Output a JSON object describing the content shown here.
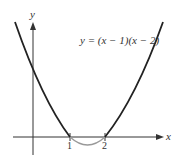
{
  "diagram": {
    "equation": "y = (x − 1)(x − 2)",
    "x_axis_label": "x",
    "y_axis_label": "y",
    "x_ticks": [
      "1",
      "2"
    ],
    "colors": {
      "curve": "#222222",
      "curve_below_axis": "#999999",
      "axes": "#333333"
    }
  }
}
